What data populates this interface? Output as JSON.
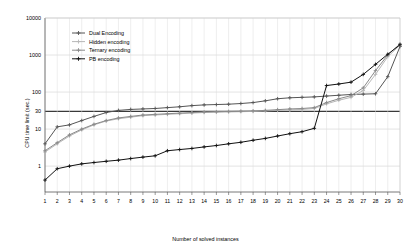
{
  "chart_data": {
    "type": "line",
    "title": "",
    "xlabel": "Number of solved instances",
    "ylabel": "CPU time limit (sec.)",
    "yscale": "log",
    "ylim": [
      0.2,
      10000
    ],
    "xlim": [
      1,
      30
    ],
    "grid": true,
    "legend_position": "top-left-inside",
    "ytick_labels": [
      "10000",
      "1000",
      "100",
      "30",
      "10",
      "1"
    ],
    "ytick_values": [
      10000,
      1000,
      100,
      30,
      10,
      1
    ],
    "xtick_labels": [
      "1",
      "2",
      "3",
      "4",
      "5",
      "6",
      "7",
      "8",
      "9",
      "10",
      "11",
      "12",
      "13",
      "14",
      "15",
      "16",
      "17",
      "18",
      "19",
      "20",
      "21",
      "22",
      "23",
      "24",
      "25",
      "26",
      "27",
      "28",
      "29",
      "30"
    ],
    "x": [
      1,
      2,
      3,
      4,
      5,
      6,
      7,
      8,
      9,
      10,
      11,
      12,
      13,
      14,
      15,
      16,
      17,
      18,
      19,
      20,
      21,
      22,
      23,
      24,
      25,
      26,
      27,
      28,
      29,
      30
    ],
    "threshold_line": {
      "value": 30,
      "label": "30"
    },
    "series": [
      {
        "name": "Dual Encoding",
        "color": "#555555",
        "marker": "cross",
        "values": [
          4.0,
          11.5,
          13.0,
          17.0,
          22.0,
          28.0,
          32.0,
          34.0,
          35.0,
          36.0,
          38.0,
          40.0,
          43.0,
          45.0,
          46.0,
          47.0,
          49.0,
          52.0,
          58.0,
          66.0,
          70.0,
          72.0,
          74.0,
          78.0,
          82.0,
          86.0,
          88.0,
          90.0,
          260.0,
          1700.0
        ]
      },
      {
        "name": "Hidden encoding",
        "color": "#b8b8b8",
        "marker": "cross",
        "values": [
          2.4,
          4.0,
          6.5,
          9.5,
          13.0,
          16.5,
          19.0,
          21.0,
          23.0,
          24.0,
          25.0,
          26.0,
          27.0,
          28.0,
          28.5,
          29.0,
          29.5,
          30.0,
          31.0,
          32.0,
          33.0,
          34.0,
          36.0,
          48.0,
          60.0,
          72.0,
          110.0,
          300.0,
          900.0,
          1850.0
        ]
      },
      {
        "name": "Ternary encoding",
        "color": "#8a8a8a",
        "marker": "cross",
        "values": [
          2.6,
          4.3,
          7.0,
          10.0,
          13.5,
          17.0,
          20.0,
          22.0,
          24.0,
          25.0,
          26.0,
          27.0,
          28.0,
          29.0,
          29.5,
          30.0,
          30.5,
          31.0,
          32.0,
          33.5,
          35.0,
          36.0,
          38.0,
          52.0,
          66.0,
          80.0,
          130.0,
          380.0,
          1000.0,
          2000.0
        ]
      },
      {
        "name": "PB encoding",
        "color": "#111111",
        "marker": "cross",
        "values": [
          0.42,
          0.85,
          1.0,
          1.15,
          1.25,
          1.35,
          1.45,
          1.6,
          1.75,
          1.9,
          2.6,
          2.8,
          3.0,
          3.3,
          3.6,
          4.0,
          4.4,
          5.0,
          5.6,
          6.5,
          7.5,
          8.5,
          10.5,
          150.0,
          165.0,
          185.0,
          300.0,
          560.0,
          1050.0,
          1900.0
        ]
      }
    ]
  }
}
